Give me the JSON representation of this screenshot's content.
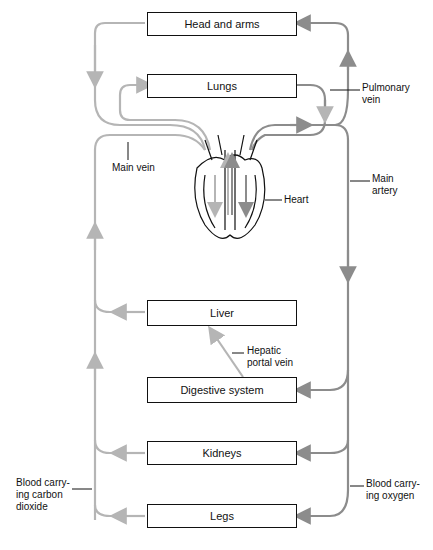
{
  "organs": {
    "head": "Head and arms",
    "lungs": "Lungs",
    "liver": "Liver",
    "digestive": "Digestive system",
    "kidneys": "Kidneys",
    "legs": "Legs"
  },
  "labels": {
    "pulmonary_vein_1": "Pulmonary",
    "pulmonary_vein_2": "vein",
    "main_vein": "Main vein",
    "heart": "Heart",
    "main_artery_1": "Main",
    "main_artery_2": "artery",
    "hepatic_1": "Hepatic",
    "hepatic_2": "portal vein",
    "co2_1": "Blood carry-",
    "co2_2": "ing carbon",
    "co2_3": "dioxide",
    "o2_1": "Blood carry-",
    "o2_2": "ing oxygen"
  },
  "colors": {
    "deoxygenated": "#b5b5b5",
    "oxygenated": "#8c8c8c",
    "outline": "#111111"
  }
}
